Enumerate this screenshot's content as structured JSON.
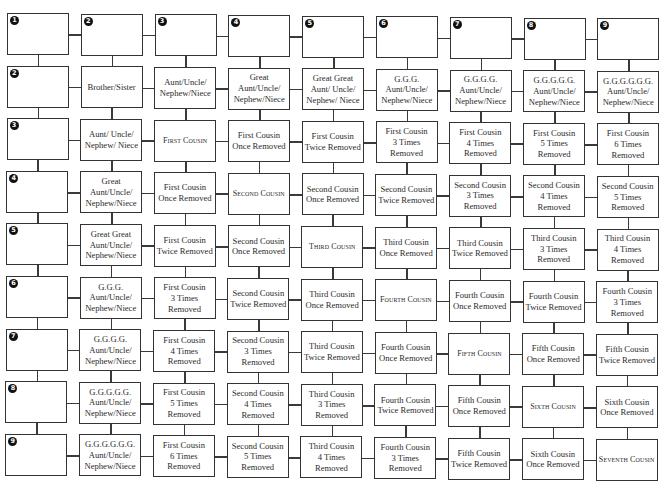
{
  "colors": {
    "border": "#333333",
    "text": "#2b2b2b",
    "badge": "#111111",
    "background": "#ffffff"
  },
  "badges": [
    "1",
    "2",
    "3",
    "4",
    "5",
    "6",
    "7",
    "8",
    "9"
  ],
  "grid": [
    [
      "",
      "",
      "",
      "",
      "",
      "",
      "",
      "",
      ""
    ],
    [
      "",
      "Brother/Sister",
      "Aunt/Uncle/\nNephew/Niece",
      "Great\nAunt/Uncle/\nNephew/Niece",
      "Great Great\nAunt/ Uncle/\nNephew/ Niece",
      "G.G.G.\nAunt/Uncle/\nNephew/Niece",
      "G.G.G.G.\nAunt/Uncle/\nNephew/Niece",
      "G.G.G.G.G.\nAunt/Uncle/\nNephew/Niece",
      "G.G.G.G.G.G.\nAunt/Uncle/\nNephew/Niece"
    ],
    [
      "",
      "Aunt/ Uncle/\nNephew/ Niece",
      "First Cousin",
      "First Cousin\nOnce Removed",
      "First Cousin\nTwice Removed",
      "First Cousin\n3 Times\nRemoved",
      "First Cousin\n4 Times\nRemoved",
      "First Cousin\n5 Times\nRemoved",
      "First Cousin\n6 Times\nRemoved"
    ],
    [
      "",
      "Great\nAunt/Uncle/\nNephew/Niece",
      "First Cousin\nOnce Removed",
      "Second Cousin",
      "Second Cousin\nOnce Removed",
      "Second Cousin\nTwice Removed",
      "Second Cousin\n3 Times\nRemoved",
      "Second Cousin\n4 Times\nRemoved",
      "Second Cousin\n5 Times\nRemoved"
    ],
    [
      "",
      "Great Great\nAunt/Uncle/\nNephew/Niece",
      "First Cousin\nTwice Removed",
      "Second Cousin\nOnce Removed",
      "Third Cousin",
      "Third Cousin\nOnce Removed",
      "Third Cousin\nTwice Removed",
      "Third Cousin\n3 Times\nRemoved",
      "Third Cousin\n4 Times\nRemoved"
    ],
    [
      "",
      "G.G.G.\nAunt/Uncle/\nNephew/Niece",
      "First Cousin\n3 Times\nRemoved",
      "Second Cousin\nTwice Removed",
      "Third Cousin\nOnce Removed",
      "Fourth Cousin",
      "Fourth Cousin\nOnce Removed",
      "Fourth Cousin\nTwice Removed",
      "Fourth Cousin\n3 Times\nRemoved"
    ],
    [
      "",
      "G.G.G.G.\nAunt/Uncle/\nNephew/Niece",
      "First Cousin\n4 Times\nRemoved",
      "Second Cousin\n3 Times\nRemoved",
      "Third Cousin\nTwice Removed",
      "Fourth Cousin\nOnce Removed",
      "Fifth Cousin",
      "Fifth Cousin\nOnce Removed",
      "Fifth Cousin\nTwice Removed"
    ],
    [
      "",
      "G.G.G.G.G.\nAunt/Uncle/\nNephew/Niece",
      "First Cousin\n5 Times\nRemoved",
      "Second Cousin\n4 Times\nRemoved",
      "Third Cousin\n3 Times\nRemoved",
      "Fourth Cousin\nTwice Removed",
      "Fifth Cousin\nOnce Removed",
      "Sixth Cousin",
      "Sixth Cousin\nOnce Removed"
    ],
    [
      "",
      "G.G.G.G.G.G.\nAunt/Uncle/\nNephew/Niece",
      "First Cousin\n6 Times\nRemoved",
      "Second Cousin\n5 Times\nRemoved",
      "Third Cousin\n4 Times\nRemoved",
      "Fourth Cousin\n3 Times\nRemoved",
      "Fifth Cousin\nTwice Removed",
      "Sixth Cousin\nOnce Removed",
      "Seventh Cousin"
    ]
  ],
  "small_caps_cells": [
    [
      2,
      2
    ],
    [
      3,
      3
    ],
    [
      4,
      4
    ],
    [
      5,
      5
    ],
    [
      6,
      6
    ],
    [
      7,
      7
    ],
    [
      8,
      8
    ]
  ]
}
